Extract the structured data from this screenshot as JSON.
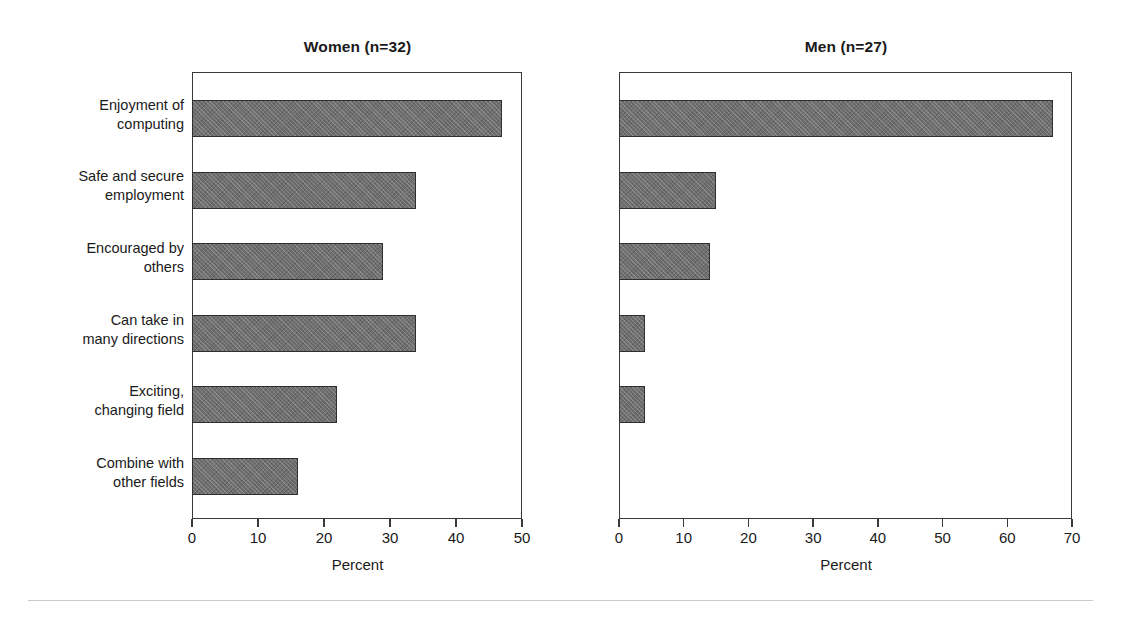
{
  "chart_data": {
    "type": "bar",
    "orientation": "horizontal",
    "title": "",
    "grid": false,
    "legend": null,
    "categories": [
      "Enjoyment of\ncomputing",
      "Safe and secure\nemployment",
      "Encouraged by\nothers",
      "Can take in\nmany directions",
      "Exciting,\nchanging field",
      "Combine with\nother fields"
    ],
    "panels": [
      {
        "id": "women",
        "title": "Women (n=32)",
        "n": 32,
        "xlabel": "Percent",
        "xlim": [
          0,
          50
        ],
        "xticks": [
          0,
          10,
          20,
          30,
          40,
          50
        ],
        "xtick_labels": [
          "0",
          "10",
          "20",
          "30",
          "40",
          "50"
        ],
        "values": [
          47,
          34,
          29,
          34,
          22,
          16
        ]
      },
      {
        "id": "men",
        "title": "Men (n=27)",
        "n": 27,
        "xlabel": "Percent",
        "xlim": [
          0,
          70
        ],
        "xticks": [
          0,
          10,
          20,
          30,
          40,
          50,
          60,
          70
        ],
        "xtick_labels": [
          "0",
          "10",
          "20",
          "30",
          "40",
          "50",
          "60",
          "70"
        ],
        "values": [
          67,
          15,
          14,
          4,
          4,
          0
        ]
      }
    ],
    "series": [
      {
        "name": "Women (n=32)",
        "values": [
          47,
          34,
          29,
          34,
          22,
          16
        ]
      },
      {
        "name": "Men (n=27)",
        "values": [
          67,
          15,
          14,
          4,
          4,
          0
        ]
      }
    ],
    "xlabel": "Percent",
    "ylabel": "",
    "colors": {
      "bar_fill": "#6f6f6f",
      "bar_edge": "#2f2f2f",
      "axis": "#3a3a3a",
      "text": "#1a1a1a",
      "background": "#ffffff",
      "rule": "#c9c9c9"
    }
  }
}
